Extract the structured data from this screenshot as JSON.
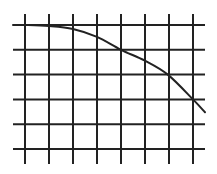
{
  "chart_data": {
    "type": "line",
    "title": "",
    "xlabel": "",
    "ylabel": "",
    "grid": true,
    "legend": null,
    "grid_columns": 8,
    "grid_rows": 6,
    "x_ticks": [
      0,
      1,
      2,
      3,
      4,
      5,
      6,
      7
    ],
    "y_ticks": [
      0,
      1,
      2,
      3,
      4,
      5
    ],
    "xlim": [
      -0.5,
      7.5
    ],
    "ylim": [
      0.6,
      5.5
    ],
    "series": [
      {
        "name": "curve",
        "x": [
          -0.5,
          0,
          1,
          2,
          3,
          4,
          5,
          5.95,
          7,
          7.5
        ],
        "y": [
          5.0,
          5.0,
          4.96,
          4.84,
          4.52,
          4.0,
          3.56,
          3.0,
          2.0,
          1.48
        ]
      }
    ]
  },
  "colors": {
    "background": "#ffffff",
    "grid": "#222222",
    "curve": "#222222"
  }
}
